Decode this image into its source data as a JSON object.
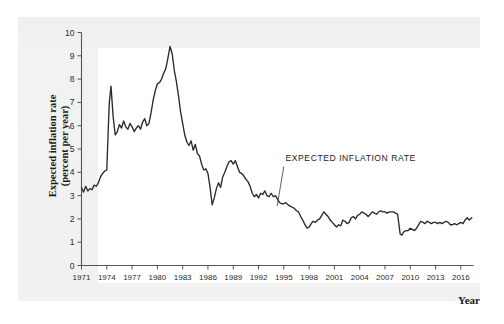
{
  "chart_data": {
    "type": "line",
    "title": "",
    "xlabel": "Year",
    "ylabel": "Expected inflation rate (percent per year)",
    "ylabel_line1": "Expected inflation rate",
    "ylabel_line2": "(percent per year)",
    "xlim": [
      1971,
      2017.5
    ],
    "ylim": [
      0,
      10
    ],
    "grid": false,
    "legend": "none",
    "series_name": "EXPECTED INFLATION RATE",
    "annotations": [
      {
        "text": "EXPECTED INFLATION RATE",
        "text_x": 1995.2,
        "text_y": 4.5,
        "leader_from_x": 1995.0,
        "leader_from_y": 4.25,
        "leader_to_x": 1994.2,
        "leader_to_y": 2.55
      }
    ],
    "xticks": [
      1971,
      1974,
      1977,
      1980,
      1983,
      1986,
      1989,
      1992,
      1995,
      1998,
      2001,
      2004,
      2007,
      2010,
      2013,
      2016
    ],
    "yticks": [
      0,
      1,
      2,
      3,
      4,
      5,
      6,
      7,
      8,
      9,
      10
    ],
    "line_color": "#2a2a2a",
    "axis_color": "#555555",
    "x": [
      1971.0,
      1971.25,
      1971.5,
      1971.75,
      1972.0,
      1972.25,
      1972.5,
      1972.75,
      1973.0,
      1973.25,
      1973.5,
      1973.75,
      1974.0,
      1974.15,
      1974.3,
      1974.5,
      1974.75,
      1975.0,
      1975.25,
      1975.5,
      1975.75,
      1976.0,
      1976.25,
      1976.5,
      1976.75,
      1977.0,
      1977.25,
      1977.5,
      1977.75,
      1978.0,
      1978.25,
      1978.5,
      1978.75,
      1979.0,
      1979.25,
      1979.5,
      1979.75,
      1980.0,
      1980.25,
      1980.5,
      1980.75,
      1981.0,
      1981.25,
      1981.5,
      1981.75,
      1982.0,
      1982.25,
      1982.5,
      1982.75,
      1983.0,
      1983.25,
      1983.5,
      1983.75,
      1984.0,
      1984.25,
      1984.5,
      1984.75,
      1985.0,
      1985.25,
      1985.5,
      1985.75,
      1986.0,
      1986.25,
      1986.5,
      1986.75,
      1987.0,
      1987.25,
      1987.5,
      1987.75,
      1988.0,
      1988.25,
      1988.5,
      1988.75,
      1989.0,
      1989.25,
      1989.5,
      1989.75,
      1990.0,
      1990.25,
      1990.5,
      1990.75,
      1991.0,
      1991.25,
      1991.5,
      1991.75,
      1992.0,
      1992.25,
      1992.5,
      1992.75,
      1993.0,
      1993.25,
      1993.5,
      1993.75,
      1994.0,
      1994.25,
      1994.5,
      1994.75,
      1995.0,
      1995.25,
      1995.5,
      1995.75,
      1996.0,
      1996.25,
      1996.5,
      1996.75,
      1997.0,
      1997.25,
      1997.5,
      1997.75,
      1998.0,
      1998.25,
      1998.5,
      1998.75,
      1999.0,
      1999.25,
      1999.5,
      1999.75,
      2000.0,
      2000.25,
      2000.5,
      2000.75,
      2001.0,
      2001.25,
      2001.5,
      2001.75,
      2002.0,
      2002.25,
      2002.5,
      2002.75,
      2003.0,
      2003.25,
      2003.5,
      2003.75,
      2004.0,
      2004.25,
      2004.5,
      2004.75,
      2005.0,
      2005.25,
      2005.5,
      2005.75,
      2006.0,
      2006.25,
      2006.5,
      2006.75,
      2007.0,
      2007.25,
      2007.5,
      2007.75,
      2008.0,
      2008.25,
      2008.5,
      2008.8,
      2009.0,
      2009.25,
      2009.5,
      2009.75,
      2010.0,
      2010.25,
      2010.5,
      2010.75,
      2011.0,
      2011.25,
      2011.5,
      2011.75,
      2012.0,
      2012.25,
      2012.5,
      2012.75,
      2013.0,
      2013.25,
      2013.5,
      2013.75,
      2014.0,
      2014.25,
      2014.5,
      2014.75,
      2015.0,
      2015.25,
      2015.5,
      2015.75,
      2016.0,
      2016.25,
      2016.5,
      2016.75,
      2017.0,
      2017.3
    ],
    "values": [
      3.35,
      3.15,
      3.4,
      3.2,
      3.3,
      3.25,
      3.45,
      3.4,
      3.55,
      3.8,
      3.95,
      4.05,
      4.1,
      5.6,
      7.0,
      7.7,
      6.4,
      5.6,
      5.75,
      6.05,
      5.9,
      6.2,
      5.95,
      5.85,
      6.1,
      5.95,
      5.75,
      5.9,
      6.0,
      5.85,
      6.15,
      6.3,
      6.0,
      6.1,
      6.55,
      7.1,
      7.5,
      7.8,
      7.85,
      8.0,
      8.25,
      8.45,
      8.9,
      9.4,
      9.1,
      8.4,
      7.9,
      7.3,
      6.6,
      6.1,
      5.6,
      5.3,
      5.15,
      5.35,
      4.95,
      5.2,
      4.8,
      4.7,
      4.35,
      4.1,
      4.15,
      3.95,
      3.35,
      2.6,
      2.9,
      3.3,
      3.55,
      3.35,
      3.8,
      4.0,
      4.25,
      4.45,
      4.5,
      4.35,
      4.5,
      4.25,
      4.0,
      3.95,
      3.85,
      3.7,
      3.6,
      3.4,
      3.1,
      2.95,
      3.05,
      2.9,
      3.1,
      3.05,
      3.2,
      3.0,
      2.95,
      3.1,
      2.95,
      3.0,
      2.85,
      2.7,
      2.65,
      2.65,
      2.7,
      2.6,
      2.55,
      2.5,
      2.45,
      2.35,
      2.3,
      2.1,
      1.95,
      1.75,
      1.6,
      1.65,
      1.8,
      1.9,
      1.85,
      1.95,
      2.0,
      2.15,
      2.3,
      2.2,
      2.1,
      1.95,
      1.85,
      1.75,
      1.65,
      1.75,
      1.7,
      1.95,
      1.9,
      1.8,
      1.85,
      2.05,
      2.1,
      2.0,
      2.15,
      2.2,
      2.3,
      2.25,
      2.2,
      2.1,
      2.2,
      2.3,
      2.25,
      2.2,
      2.3,
      2.35,
      2.3,
      2.3,
      2.25,
      2.3,
      2.3,
      2.3,
      2.25,
      2.2,
      1.35,
      1.3,
      1.45,
      1.5,
      1.5,
      1.6,
      1.55,
      1.5,
      1.6,
      1.75,
      1.9,
      1.85,
      1.8,
      1.9,
      1.85,
      1.8,
      1.85,
      1.85,
      1.8,
      1.85,
      1.8,
      1.85,
      1.9,
      1.85,
      1.75,
      1.75,
      1.8,
      1.75,
      1.8,
      1.85,
      1.8,
      1.95,
      2.05,
      1.95,
      2.05
    ]
  },
  "axes": {
    "x_axis_title": "Year",
    "y_axis_title_line1": "Expected inflation rate",
    "y_axis_title_line2": "(percent per year)"
  },
  "ghost_text": {
    "top_line": "",
    "bottom_line_1": "",
    "bottom_line_2": ""
  }
}
